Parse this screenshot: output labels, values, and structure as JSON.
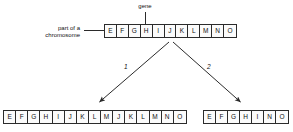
{
  "diagram": {
    "title_labels": {
      "gene": "gene",
      "chromosome_line1": "part of a",
      "chromosome_line2": "chromosome"
    },
    "arrow_labels": {
      "arrow1": "1",
      "arrow2": "2"
    },
    "colors": {
      "stroke": "#2b2b2b",
      "text": "#111111",
      "box_fill": "#fbfbfb",
      "background": "#ffffff"
    },
    "rows": {
      "original": {
        "name": "original-chromosome",
        "boxes": [
          "E",
          "F",
          "G",
          "H",
          "I",
          "J",
          "K",
          "L",
          "M",
          "N",
          "O"
        ],
        "count": 11
      },
      "duplication": {
        "name": "duplicated-chromosome",
        "boxes": [
          "E",
          "F",
          "G",
          "H",
          "I",
          "J",
          "K",
          "L",
          "M",
          "J",
          "K",
          "L",
          "M",
          "N",
          "O"
        ],
        "count": 15
      },
      "deletion": {
        "name": "deleted-chromosome",
        "boxes": [
          "E",
          "F",
          "G",
          "H",
          "I",
          "N",
          "O"
        ],
        "count": 7
      }
    }
  }
}
